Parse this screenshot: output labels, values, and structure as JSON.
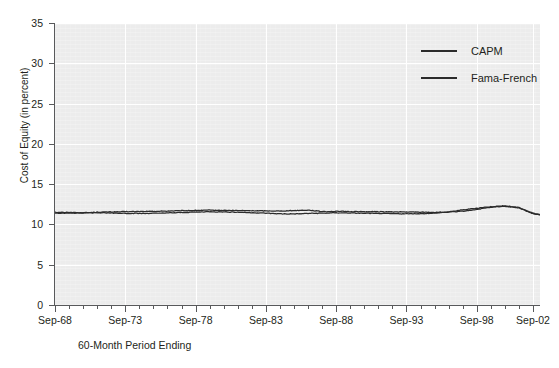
{
  "chart_data": {
    "type": "line",
    "title": "",
    "xlabel": "60-Month Period Ending",
    "ylabel": "Cost of Equity (in percent)",
    "ylim": [
      0,
      35
    ],
    "yticks": [
      0,
      5,
      10,
      15,
      20,
      25,
      30,
      35
    ],
    "xlim": [
      "Sep-68",
      "Sep-03"
    ],
    "xticks": [
      "Sep-68",
      "Sep-73",
      "Sep-78",
      "Sep-83",
      "Sep-88",
      "Sep-93",
      "Sep-98",
      "Sep-02"
    ],
    "xtick_years": [
      1968,
      1973,
      1978,
      1983,
      1988,
      1993,
      1998,
      2002
    ],
    "minor_tick_interval_years": 1,
    "grid": true,
    "grid_color": "#ffffff",
    "plot_background": "#ececec",
    "legend_position": "top-right-inside",
    "legend": [
      "CAPM",
      "Fama-French"
    ],
    "x": [
      1968.75,
      1969.75,
      1970.75,
      1971.75,
      1972.75,
      1973.75,
      1974.75,
      1975.75,
      1976.75,
      1977.75,
      1978.75,
      1979.75,
      1980.75,
      1981.75,
      1982.75,
      1983.75,
      1984.75,
      1985.75,
      1986.75,
      1987.75,
      1988.75,
      1989.75,
      1990.75,
      1991.75,
      1992.75,
      1993.75,
      1994.75,
      1995.75,
      1996.75,
      1997.75,
      1998.75,
      1999.75,
      2000.75,
      2001.75,
      2002.75,
      2003.25
    ],
    "series": [
      {
        "name": "CAPM",
        "color": "#2b2b2b",
        "values": [
          11.42,
          11.4,
          11.44,
          11.52,
          11.55,
          11.58,
          11.6,
          11.62,
          11.66,
          11.7,
          11.74,
          11.76,
          11.74,
          11.72,
          11.7,
          11.68,
          11.66,
          11.72,
          11.78,
          11.6,
          11.62,
          11.6,
          11.58,
          11.58,
          11.56,
          11.54,
          11.52,
          11.5,
          11.52,
          11.62,
          11.86,
          12.12,
          12.26,
          12.05,
          11.32,
          11.18
        ]
      },
      {
        "name": "Fama-French",
        "color": "#2b2b2b",
        "values": [
          11.52,
          11.48,
          11.46,
          11.44,
          11.42,
          11.38,
          11.36,
          11.38,
          11.42,
          11.48,
          11.54,
          11.58,
          11.56,
          11.52,
          11.46,
          11.4,
          11.32,
          11.3,
          11.36,
          11.4,
          11.44,
          11.42,
          11.38,
          11.36,
          11.34,
          11.32,
          11.34,
          11.4,
          11.56,
          11.8,
          12.02,
          12.2,
          12.3,
          12.1,
          11.4,
          11.22
        ]
      }
    ]
  },
  "axis": {
    "y_title": "Cost of Equity (in percent)",
    "x_title": "60-Month Period Ending",
    "y_ticklabels": [
      "0",
      "5",
      "10",
      "15",
      "20",
      "25",
      "30",
      "35"
    ],
    "x_ticklabels": [
      "Sep-68",
      "Sep-73",
      "Sep-78",
      "Sep-83",
      "Sep-88",
      "Sep-93",
      "Sep-98",
      "Sep-02"
    ]
  },
  "legend": {
    "items": [
      {
        "label": "CAPM",
        "color": "#2b2b2b"
      },
      {
        "label": "Fama-French",
        "color": "#2b2b2b"
      }
    ]
  }
}
